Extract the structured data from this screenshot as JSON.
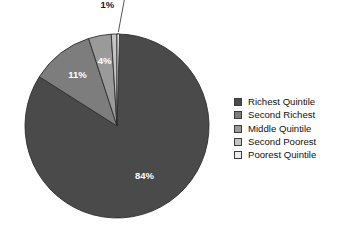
{
  "chart_data": {
    "type": "pie",
    "title": "",
    "subtitle": "",
    "xlabel": "",
    "ylabel": "",
    "grid": false,
    "legend_position": "right",
    "start_angle_deg": 0,
    "direction": "clockwise",
    "center": {
      "x": 117,
      "y": 126
    },
    "radius": 92,
    "categories": [
      "Richest Quintile",
      "Second Richest",
      "Middle Quintile",
      "Second Poorest",
      "Poorest Quintile"
    ],
    "values": [
      84,
      11,
      4,
      1,
      0
    ],
    "value_labels": [
      "84%",
      "11%",
      "4%",
      "1%",
      "0%"
    ],
    "colors": [
      "#4a4a4a",
      "#7d7d7d",
      "#9a9a9a",
      "#c4c4c4",
      "#ececec"
    ],
    "slice_label_placement": [
      "inside",
      "inside",
      "inside",
      "outside",
      "outside-leader"
    ],
    "slice_label_colors": [
      "#ffffff",
      "#ffffff",
      "#ffffff",
      "#1a1a1a",
      "#1a1a1a"
    ],
    "slice_outline_color": "#2e2e2e"
  },
  "chart": {
    "background_color": "#ffffff",
    "labels": {
      "richest": "84%",
      "second_richest": "11%",
      "middle": "4%",
      "second_poorest": "1%",
      "poorest": "0%"
    }
  },
  "legend": {
    "items": [
      {
        "label": "Richest Quintile",
        "color": "#4a4a4a"
      },
      {
        "label": "Second Richest",
        "color": "#7d7d7d"
      },
      {
        "label": "Middle Quintile",
        "color": "#9a9a9a"
      },
      {
        "label": "Second Poorest",
        "color": "#c4c4c4"
      },
      {
        "label": "Poorest Quintile",
        "color": "#ececec"
      }
    ]
  }
}
